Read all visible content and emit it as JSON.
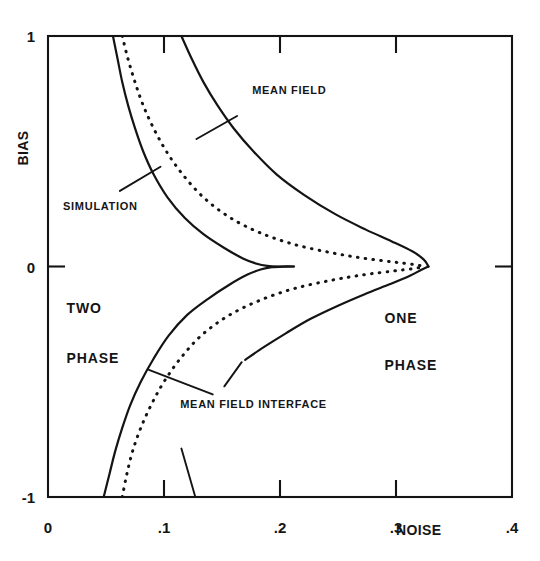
{
  "chart_data": {
    "type": "line",
    "title": "",
    "subtitle": "",
    "xlabel": "NOISE",
    "ylabel": "BIAS",
    "xlim": [
      0,
      0.4
    ],
    "ylim": [
      -1,
      1
    ],
    "grid": false,
    "legend_position": "inline-annotations",
    "x_ticks": [
      {
        "value": 0,
        "label": "0"
      },
      {
        "value": 0.1,
        "label": ".1"
      },
      {
        "value": 0.2,
        "label": ".2"
      },
      {
        "value": 0.3,
        "label": ".3"
      },
      {
        "value": 0.4,
        "label": ".4"
      }
    ],
    "y_ticks": [
      {
        "value": 1,
        "label": "1"
      },
      {
        "value": 0,
        "label": "0"
      },
      {
        "value": -1,
        "label": "-1"
      }
    ],
    "series": [
      {
        "name": "SIMULATION",
        "style": "solid",
        "branch": "upper",
        "points": [
          [
            0.056,
            1.0
          ],
          [
            0.06,
            0.9
          ],
          [
            0.064,
            0.8
          ],
          [
            0.069,
            0.7
          ],
          [
            0.075,
            0.6
          ],
          [
            0.082,
            0.5
          ],
          [
            0.091,
            0.4
          ],
          [
            0.103,
            0.3
          ],
          [
            0.118,
            0.21
          ],
          [
            0.134,
            0.14
          ],
          [
            0.152,
            0.08
          ],
          [
            0.168,
            0.035
          ],
          [
            0.18,
            0.012
          ],
          [
            0.189,
            0.003
          ],
          [
            0.2,
            0.0
          ],
          [
            0.212,
            0.0
          ]
        ]
      },
      {
        "name": "SIMULATION",
        "style": "solid",
        "branch": "lower",
        "points": [
          [
            0.048,
            -1.0
          ],
          [
            0.053,
            -0.9
          ],
          [
            0.058,
            -0.8
          ],
          [
            0.064,
            -0.7
          ],
          [
            0.071,
            -0.6
          ],
          [
            0.08,
            -0.5
          ],
          [
            0.091,
            -0.4
          ],
          [
            0.104,
            -0.3
          ],
          [
            0.12,
            -0.21
          ],
          [
            0.138,
            -0.14
          ],
          [
            0.156,
            -0.08
          ],
          [
            0.172,
            -0.035
          ],
          [
            0.184,
            -0.012
          ],
          [
            0.193,
            -0.003
          ],
          [
            0.203,
            0.0
          ],
          [
            0.212,
            0.0
          ]
        ]
      },
      {
        "name": "MEAN FIELD INTERFACE",
        "style": "dotted",
        "branch": "upper",
        "points": [
          [
            0.064,
            1.0
          ],
          [
            0.069,
            0.9
          ],
          [
            0.075,
            0.8
          ],
          [
            0.082,
            0.7
          ],
          [
            0.091,
            0.6
          ],
          [
            0.102,
            0.5
          ],
          [
            0.116,
            0.4
          ],
          [
            0.134,
            0.3
          ],
          [
            0.156,
            0.215
          ],
          [
            0.182,
            0.148
          ],
          [
            0.212,
            0.096
          ],
          [
            0.244,
            0.06
          ],
          [
            0.272,
            0.036
          ],
          [
            0.297,
            0.02
          ],
          [
            0.315,
            0.009
          ],
          [
            0.325,
            0.0
          ]
        ]
      },
      {
        "name": "MEAN FIELD INTERFACE",
        "style": "dotted",
        "branch": "lower",
        "points": [
          [
            0.064,
            -1.0
          ],
          [
            0.068,
            -0.9
          ],
          [
            0.073,
            -0.8
          ],
          [
            0.08,
            -0.7
          ],
          [
            0.089,
            -0.6
          ],
          [
            0.1,
            -0.5
          ],
          [
            0.114,
            -0.4
          ],
          [
            0.132,
            -0.3
          ],
          [
            0.155,
            -0.215
          ],
          [
            0.182,
            -0.148
          ],
          [
            0.212,
            -0.096
          ],
          [
            0.244,
            -0.06
          ],
          [
            0.272,
            -0.036
          ],
          [
            0.297,
            -0.02
          ],
          [
            0.315,
            -0.009
          ],
          [
            0.325,
            0.0
          ]
        ]
      },
      {
        "name": "MEAN FIELD",
        "style": "solid",
        "branch": "upper",
        "points": [
          [
            0.115,
            1.0
          ],
          [
            0.124,
            0.9
          ],
          [
            0.134,
            0.8
          ],
          [
            0.146,
            0.7
          ],
          [
            0.16,
            0.6
          ],
          [
            0.177,
            0.5
          ],
          [
            0.197,
            0.4
          ],
          [
            0.221,
            0.31
          ],
          [
            0.248,
            0.226
          ],
          [
            0.274,
            0.16
          ],
          [
            0.296,
            0.11
          ],
          [
            0.314,
            0.066
          ],
          [
            0.324,
            0.03
          ],
          [
            0.328,
            0.0
          ]
        ]
      },
      {
        "name": "MEAN FIELD",
        "style": "solid",
        "branch": "lower",
        "points": [
          [
            0.17,
            -0.405
          ],
          [
            0.186,
            -0.35
          ],
          [
            0.205,
            -0.29
          ],
          [
            0.226,
            -0.228
          ],
          [
            0.25,
            -0.17
          ],
          [
            0.273,
            -0.12
          ],
          [
            0.295,
            -0.076
          ],
          [
            0.312,
            -0.04
          ],
          [
            0.322,
            -0.014
          ],
          [
            0.328,
            0.0
          ]
        ]
      }
    ],
    "annotations": [
      {
        "label": "MEAN FIELD",
        "text_x": 0.176,
        "text_y": 0.748,
        "leader_from": [
          0.163,
          0.653
        ],
        "leader_to": [
          0.128,
          0.553
        ]
      },
      {
        "label": "SIMULATION",
        "text_x": 0.013,
        "text_y": 0.243,
        "leader_from": [
          0.062,
          0.328
        ],
        "leader_to": [
          0.097,
          0.433
        ]
      },
      {
        "label": "MEAN FIELD INTERFACE",
        "text_x": 0.114,
        "text_y": -0.615,
        "leader_from": [
          0.142,
          -0.555
        ],
        "leader_to": [
          0.087,
          -0.448
        ]
      }
    ],
    "region_labels": [
      {
        "label": "TWO",
        "x": 0.016,
        "y": -0.2
      },
      {
        "label": "PHASE",
        "x": 0.016,
        "y": -0.418
      },
      {
        "label": "ONE",
        "x": 0.29,
        "y": -0.247
      },
      {
        "label": "PHASE",
        "x": 0.29,
        "y": -0.449
      }
    ]
  },
  "axis": {
    "x_title": "NOISE",
    "y_title": "BIAS"
  },
  "colors": {
    "line": "#141414",
    "frame": "#141414",
    "background": "#ffffff",
    "text": "#141414"
  }
}
